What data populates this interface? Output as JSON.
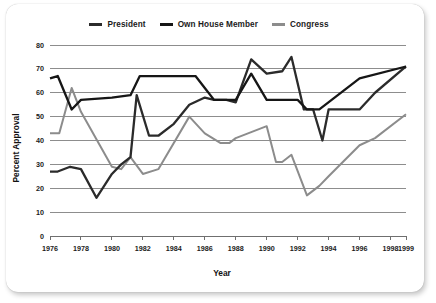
{
  "chart_data": {
    "type": "line",
    "title": "",
    "xlabel": "Year",
    "ylabel": "Percent Approval",
    "xlim": [
      1976,
      1999
    ],
    "ylim": [
      0,
      80
    ],
    "grid": true,
    "legend_position": "top-center",
    "y_ticks": [
      0,
      10,
      20,
      30,
      40,
      50,
      60,
      70,
      80
    ],
    "y_tick_labels": [
      "0",
      "10",
      "20",
      "30",
      "40",
      "50",
      "60",
      "70",
      "80"
    ],
    "x_ticks": [
      1976,
      1978,
      1980,
      1982,
      1984,
      1986,
      1988,
      1990,
      1992,
      1994,
      1996,
      1998,
      1999
    ],
    "x_tick_labels": [
      "1976",
      "1978",
      "1980",
      "1982",
      "1984",
      "1986",
      "1988",
      "1990",
      "1992",
      "1994",
      "1996",
      "1998",
      "1999"
    ],
    "colors": {
      "president": "#2b2b2b",
      "own_house_member": "#161616",
      "congress": "#8c8c8c",
      "gridline": "#8d8d8d",
      "axis": "#6f6f6f",
      "text": "#1b1b1b",
      "card_background": "#ffffff"
    },
    "series": [
      {
        "name": "President",
        "color": "#2b2b2b",
        "x": [
          1976.0,
          1976.5,
          1977.3,
          1978.0,
          1979.0,
          1980.0,
          1980.6,
          1981.2,
          1981.6,
          1982.4,
          1983.0,
          1984.0,
          1985.0,
          1986.0,
          1986.6,
          1987.4,
          1988.0,
          1989.0,
          1990.0,
          1991.0,
          1991.6,
          1992.4,
          1993.0,
          1993.6,
          1994.0,
          1996.0,
          1997.0,
          1999.0
        ],
        "y": [
          27,
          27,
          29,
          28,
          16,
          26,
          30,
          33,
          59,
          42,
          42,
          47,
          55,
          58,
          57,
          57,
          56,
          74,
          68,
          69,
          75,
          53,
          53,
          40,
          53,
          53,
          60,
          71
        ]
      },
      {
        "name": "Own House Member",
        "color": "#161616",
        "x": [
          1976.0,
          1976.5,
          1977.4,
          1978.0,
          1980.0,
          1981.2,
          1981.8,
          1983.0,
          1985.4,
          1986.0,
          1986.6,
          1987.4,
          1988.0,
          1989.0,
          1990.0,
          1991.0,
          1992.0,
          1992.6,
          1993.4,
          1996.0,
          1999.0
        ],
        "y": [
          66,
          67,
          53,
          57,
          58,
          59,
          67,
          67,
          67,
          62,
          57,
          57,
          57,
          68,
          57,
          57,
          57,
          53,
          53,
          66,
          71
        ]
      },
      {
        "name": "Congress",
        "color": "#8c8c8c",
        "x": [
          1976.0,
          1976.6,
          1977.4,
          1978.0,
          1980.0,
          1980.6,
          1981.2,
          1982.0,
          1983.0,
          1985.0,
          1986.0,
          1987.0,
          1987.6,
          1988.0,
          1990.0,
          1990.6,
          1991.0,
          1991.6,
          1992.6,
          1993.4,
          1994.0,
          1996.0,
          1997.0,
          1999.0
        ],
        "y": [
          43,
          43,
          62,
          52,
          29,
          28,
          33,
          26,
          28,
          50,
          43,
          39,
          39,
          41,
          46,
          31,
          31,
          34,
          17,
          21,
          25,
          38,
          41,
          51
        ]
      }
    ]
  },
  "legend": {
    "items": [
      {
        "label": "President",
        "color": "#2b2b2b"
      },
      {
        "label": "Own House Member",
        "color": "#161616"
      },
      {
        "label": "Congress",
        "color": "#8c8c8c"
      }
    ]
  }
}
